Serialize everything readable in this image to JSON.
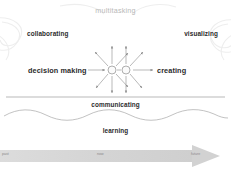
{
  "diagram": {
    "title": "multitasking",
    "nodes": [
      {
        "id": "collaborating",
        "label": "collaborating"
      },
      {
        "id": "visualizing",
        "label": "visualizing"
      },
      {
        "id": "decision-making",
        "label": "decision making"
      },
      {
        "id": "creating",
        "label": "creating"
      },
      {
        "id": "communicating",
        "label": "communicating"
      },
      {
        "id": "learning",
        "label": "learning"
      }
    ],
    "hubs": [
      {
        "id": "hub-left",
        "cx": 112,
        "cy": 70,
        "r": 4
      },
      {
        "id": "hub-right",
        "cx": 126,
        "cy": 70,
        "r": 4
      }
    ],
    "timeline": {
      "past": "past",
      "now": "now",
      "future": "future"
    },
    "colors": {
      "title": "#b8b8b8",
      "label": "#2b2b2b",
      "stroke": "#909090",
      "background_art": "#eeeeee",
      "timeline_bar": "#d9d9d9",
      "timeline_label": "#8a8a8a",
      "divider": "#9b9b9b",
      "wave": "#a8a8a8"
    }
  }
}
